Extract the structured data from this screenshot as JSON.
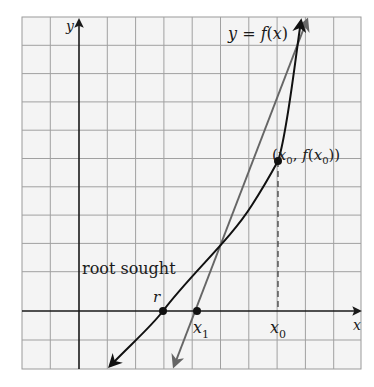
{
  "figure": {
    "type": "newtons-method-illustration",
    "grid": {
      "x_min_px": 22,
      "x_max_px": 361,
      "y_min_px": 17,
      "y_max_px": 369,
      "cell_px": 28.3,
      "color": "#9a9a9a",
      "background": "#f4f4f4"
    },
    "axes": {
      "x_label": "x",
      "y_label": "y",
      "origin_px": [
        79,
        311
      ],
      "color": "#1a1a1a"
    },
    "curve": {
      "label": "y = f(x)",
      "label_parts": {
        "y": "y",
        "eq": " = ",
        "f": "f",
        "open": "(",
        "x": "x",
        "close": ")"
      },
      "color": "#111111"
    },
    "tangent": {
      "color": "#666666",
      "description": "tangent line at (x0, f(x0))"
    },
    "points": {
      "root": {
        "label": "r",
        "px": [
          163,
          311
        ]
      },
      "x1": {
        "label": "x",
        "sub": "1",
        "px": [
          197,
          311
        ]
      },
      "x0": {
        "label": "x",
        "sub": "0",
        "px": [
          278,
          311
        ]
      },
      "tangent_point": {
        "label": "(x0, f(x0))",
        "parts": [
          "(",
          "x",
          "0",
          ", ",
          "f",
          "(",
          "x",
          "0",
          "))"
        ],
        "px": [
          278,
          161
        ]
      }
    },
    "annotations": {
      "root_sought": "root sought"
    }
  }
}
